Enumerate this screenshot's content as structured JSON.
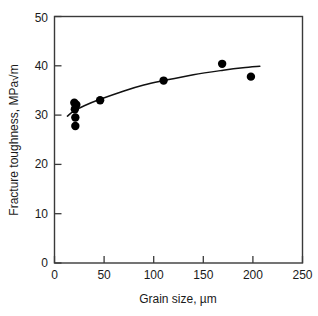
{
  "chart_data": {
    "type": "scatter",
    "title": "",
    "xlabel": "Grain size, µm",
    "ylabel": "Fracture toughness, MPa√m",
    "xlim": [
      0,
      250
    ],
    "ylim": [
      0,
      50
    ],
    "xticks": [
      0,
      50,
      100,
      150,
      200,
      250
    ],
    "yticks": [
      0,
      10,
      20,
      30,
      40,
      50
    ],
    "xtick_labels": [
      "0",
      "50",
      "100",
      "150",
      "200",
      "250"
    ],
    "ytick_labels": [
      "0",
      "10",
      "20",
      "30",
      "40",
      "50"
    ],
    "grid": false,
    "legend": false,
    "legend_position": "none",
    "marker": "filled-circle",
    "marker_color": "#000000",
    "curve_color": "#111111",
    "series": [
      {
        "name": "Measured fracture toughness",
        "type": "scatter",
        "points": [
          {
            "x": 20,
            "y": 32.5
          },
          {
            "x": 22,
            "y": 32.1
          },
          {
            "x": 20.5,
            "y": 31.2
          },
          {
            "x": 21,
            "y": 29.5
          },
          {
            "x": 21,
            "y": 27.8
          },
          {
            "x": 46,
            "y": 33.0
          },
          {
            "x": 110,
            "y": 37.0
          },
          {
            "x": 169,
            "y": 40.4
          },
          {
            "x": 198,
            "y": 37.8
          }
        ]
      },
      {
        "name": "Fitted trend curve",
        "type": "line",
        "points": [
          {
            "x": 13,
            "y": 29.8
          },
          {
            "x": 20,
            "y": 30.9
          },
          {
            "x": 30,
            "y": 31.9
          },
          {
            "x": 46,
            "y": 33.2
          },
          {
            "x": 70,
            "y": 34.9
          },
          {
            "x": 90,
            "y": 36.1
          },
          {
            "x": 110,
            "y": 37.0
          },
          {
            "x": 140,
            "y": 38.2
          },
          {
            "x": 170,
            "y": 39.1
          },
          {
            "x": 190,
            "y": 39.6
          },
          {
            "x": 207,
            "y": 39.9
          }
        ]
      }
    ]
  }
}
